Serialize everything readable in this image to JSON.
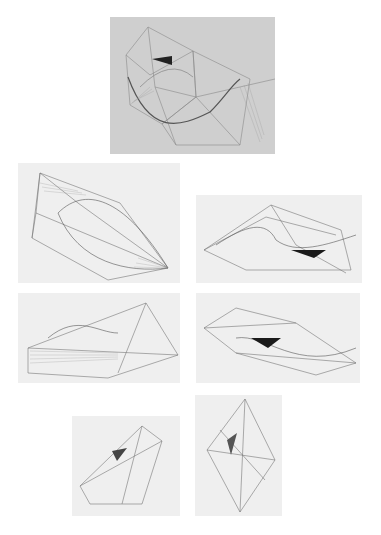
{
  "figure": {
    "panels": [
      {
        "id": "drawing-1",
        "label": "Pencil drawing of interlocking polyhedra with ruled surfaces and small dark triangle",
        "tone": "#cfcfcf"
      },
      {
        "id": "drawing-2",
        "label": "Wireframe construction with elongated ruled curve",
        "tone": "#efefef"
      },
      {
        "id": "drawing-3",
        "label": "Wireframe construction with black triangle",
        "tone": "#efefef"
      },
      {
        "id": "drawing-4",
        "label": "Wireframe construction with dense ruled surfaces",
        "tone": "#efefef"
      },
      {
        "id": "drawing-5",
        "label": "Wireframe construction with black triangle, elongated",
        "tone": "#efefef"
      },
      {
        "id": "drawing-6",
        "label": "Tilted wireframe construction with shaded surfaces",
        "tone": "#efefef"
      },
      {
        "id": "drawing-7",
        "label": "Vertical diamond-shaped wireframe construction",
        "tone": "#efefef"
      }
    ],
    "colors": {
      "background": "#ffffff",
      "line": "#6a6a6a",
      "dark_fill": "#1a1a1a"
    }
  }
}
